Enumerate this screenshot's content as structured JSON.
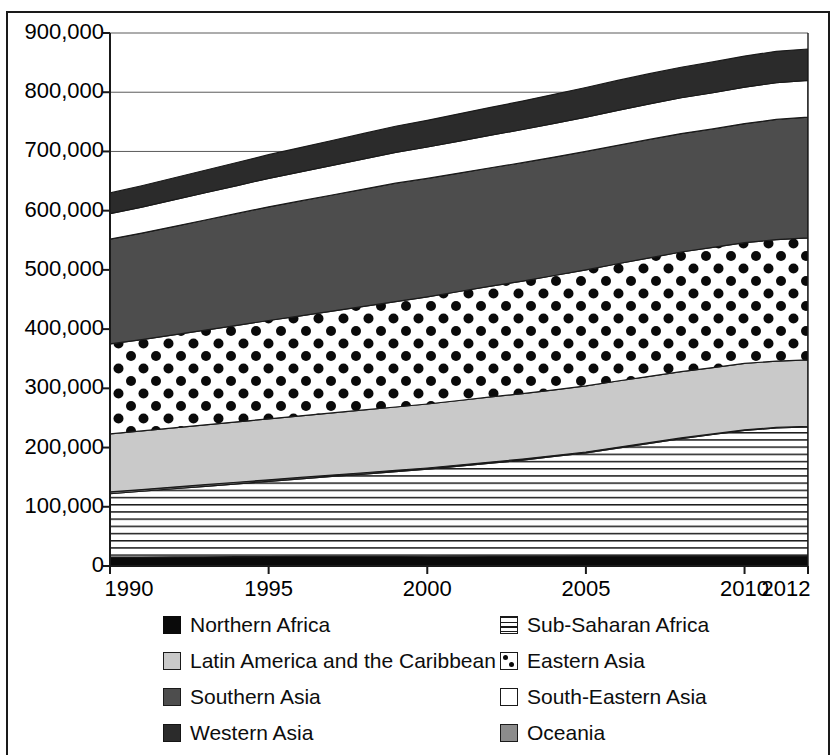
{
  "chart_data": {
    "type": "area",
    "stacked": true,
    "title": "",
    "subtitle": "",
    "xlabel": "",
    "ylabel": "",
    "x": [
      1990,
      1991,
      1992,
      1993,
      1994,
      1995,
      1996,
      1997,
      1998,
      1999,
      2000,
      2001,
      2002,
      2003,
      2004,
      2005,
      2006,
      2007,
      2008,
      2009,
      2010,
      2011,
      2012
    ],
    "xlim": [
      1990,
      2012
    ],
    "ylim": [
      0,
      900000
    ],
    "grid": true,
    "grid_axis": "y",
    "legend_position": "bottom",
    "legend_columns": 2,
    "x_tick_labels": [
      "1990",
      "1995",
      "2000",
      "2005",
      "2010",
      "2012"
    ],
    "x_tick_values": [
      1990,
      1995,
      2000,
      2005,
      2010,
      2012
    ],
    "y_tick_labels": [
      "0",
      "100,000",
      "200,000",
      "300,000",
      "400,000",
      "500,000",
      "600,000",
      "700,000",
      "800,000",
      "900,000"
    ],
    "y_tick_values": [
      0,
      100000,
      200000,
      300000,
      400000,
      500000,
      600000,
      700000,
      800000,
      900000
    ],
    "series": [
      {
        "name": "Northern Africa",
        "fill": "solid-black",
        "color": "#0a0a0a",
        "values": [
          15000,
          15200,
          15400,
          15600,
          15800,
          16000,
          16100,
          16200,
          16300,
          16400,
          16500,
          16600,
          16700,
          16800,
          16900,
          17000,
          17000,
          17000,
          17000,
          17000,
          17000,
          17000,
          17000
        ]
      },
      {
        "name": "Sub-Saharan Africa",
        "fill": "horizontal-lines",
        "color": "#ffffff",
        "values": [
          107000,
          111000,
          115000,
          119000,
          123000,
          127000,
          131000,
          135000,
          139000,
          143000,
          147000,
          152000,
          157000,
          162000,
          168000,
          174000,
          182000,
          190000,
          198000,
          205000,
          212000,
          216000,
          218000
        ]
      },
      {
        "name": "Oceania",
        "fill": "mid-gray",
        "color": "#8c8c8c",
        "values": [
          3000,
          2900,
          2800,
          2700,
          2600,
          2500,
          2400,
          2300,
          2200,
          2100,
          2000,
          1900,
          1800,
          1700,
          1600,
          1500,
          1400,
          1300,
          1200,
          1100,
          1000,
          1000,
          1000
        ]
      },
      {
        "name": "Latin America and the Caribbean",
        "fill": "light-gray",
        "color": "#c9c9c9",
        "values": [
          98000,
          99000,
          100000,
          101000,
          102000,
          103000,
          104000,
          105000,
          106000,
          107000,
          108000,
          109000,
          110000,
          110500,
          111000,
          111500,
          112000,
          112000,
          112000,
          112000,
          112000,
          112000,
          112000
        ]
      },
      {
        "name": "Eastern Asia",
        "fill": "dots",
        "color": "#ffffff",
        "values": [
          152000,
          154000,
          157000,
          160000,
          163000,
          166000,
          169000,
          172000,
          175000,
          178000,
          181000,
          184000,
          187000,
          190000,
          193000,
          196000,
          198000,
          200000,
          202000,
          203000,
          204000,
          205000,
          206000
        ]
      },
      {
        "name": "Southern Asia",
        "fill": "dark-gray",
        "color": "#4d4d4d",
        "values": [
          177000,
          180000,
          183000,
          186000,
          189000,
          192000,
          194000,
          196000,
          198000,
          200000,
          200000,
          200000,
          200000,
          200000,
          200000,
          200000,
          200000,
          200000,
          200000,
          200000,
          201000,
          203000,
          204000
        ]
      },
      {
        "name": "South-Eastern Asia",
        "fill": "white",
        "color": "#ffffff",
        "values": [
          43000,
          44000,
          45000,
          46000,
          47000,
          48000,
          49000,
          50000,
          51000,
          52000,
          53000,
          54000,
          55000,
          56000,
          57000,
          58000,
          59000,
          60000,
          60500,
          61000,
          61500,
          62000,
          62000
        ]
      },
      {
        "name": "Western Asia",
        "fill": "very-dark",
        "color": "#2b2b2b",
        "values": [
          35000,
          36000,
          37000,
          38000,
          39000,
          40000,
          41000,
          42000,
          43000,
          44000,
          45000,
          46000,
          47000,
          48000,
          49000,
          50000,
          50500,
          51000,
          51500,
          52000,
          52500,
          53000,
          53000
        ]
      }
    ],
    "cumulative_totals": [
      630000,
      642100,
      655200,
      669300,
      681400,
      694500,
      706500,
      718500,
      730500,
      742500,
      752500,
      763500,
      774500,
      783000,
      796500,
      808000,
      819900,
      831300,
      842200,
      851100,
      861000,
      869000,
      873000
    ]
  },
  "legend": {
    "left_column": [
      {
        "label": "Northern Africa",
        "swatch": "solid-black",
        "icon": "legend-swatch-northern-africa"
      },
      {
        "label": "Latin America and the Caribbean",
        "swatch": "light-gray",
        "icon": "legend-swatch-latin-america"
      },
      {
        "label": "Southern Asia",
        "swatch": "dark-gray",
        "icon": "legend-swatch-southern-asia"
      },
      {
        "label": "Western Asia",
        "swatch": "very-dark",
        "icon": "legend-swatch-western-asia"
      }
    ],
    "right_column": [
      {
        "label": "Sub-Saharan Africa",
        "swatch": "horizontal-lines",
        "icon": "legend-swatch-sub-saharan-africa"
      },
      {
        "label": "Eastern Asia",
        "swatch": "dots",
        "icon": "legend-swatch-eastern-asia"
      },
      {
        "label": "South-Eastern Asia",
        "swatch": "white",
        "icon": "legend-swatch-south-eastern-asia"
      },
      {
        "label": "Oceania",
        "swatch": "mid-gray",
        "icon": "legend-swatch-oceania"
      }
    ]
  },
  "colors": {
    "northern_africa": "#0a0a0a",
    "sub_saharan_africa": "#ffffff",
    "latin_america": "#c9c9c9",
    "eastern_asia": "#ffffff",
    "southern_asia": "#4d4d4d",
    "south_eastern_asia": "#ffffff",
    "western_asia": "#2b2b2b",
    "oceania": "#8c8c8c",
    "axis": "#1a1a1a",
    "grid": "#5a5a5a",
    "text": "#0d0d0d",
    "background": "#ffffff"
  }
}
